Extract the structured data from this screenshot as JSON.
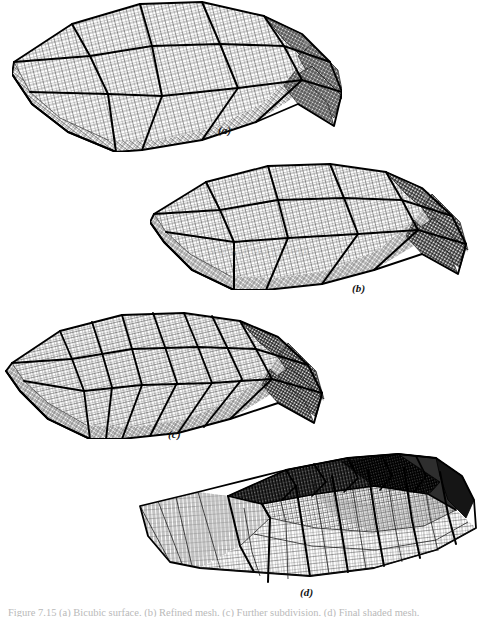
{
  "figure": {
    "type": "technical-illustration",
    "background_color": "#ffffff",
    "ink_color": "#000000",
    "caption_text": "Figure 7.15  (a) Bicubic surface. (b) Refined mesh. (c) Further subdivision. (d) Final shaded mesh.",
    "watermark_text": "www.docin.com",
    "panels": [
      {
        "id": "a",
        "label": "(a)",
        "label_x": 218,
        "label_y": 124,
        "origin_x": 12,
        "origin_y": 0,
        "width": 330,
        "height": 150,
        "patch_cols": 3,
        "patch_rows": 3,
        "fine_cols": 26,
        "fine_rows": 22,
        "shade": "#b7b7b7",
        "description": "Coarse patch layout, fine underlying grid, curved vaulted roof form"
      },
      {
        "id": "b",
        "label": "(b)",
        "label_x": 352,
        "label_y": 282,
        "origin_x": 150,
        "origin_y": 158,
        "width": 330,
        "height": 130,
        "patch_cols": 4,
        "patch_rows": 3,
        "fine_cols": 28,
        "fine_rows": 22,
        "shade": "#b0b0b0",
        "description": "Same surface with one additional column of patches"
      },
      {
        "id": "c",
        "label": "(c)",
        "label_x": 168,
        "label_y": 428,
        "origin_x": 2,
        "origin_y": 305,
        "width": 330,
        "height": 130,
        "patch_cols": 6,
        "patch_rows": 3,
        "fine_cols": 30,
        "fine_rows": 22,
        "shade": "#a8a8a8",
        "description": "Denser patch subdivision across the span"
      },
      {
        "id": "d",
        "label": "(d)",
        "label_x": 300,
        "label_y": 586,
        "origin_x": 136,
        "origin_y": 452,
        "width": 344,
        "height": 132,
        "patch_cols": 7,
        "patch_rows": 4,
        "fine_cols": 34,
        "fine_rows": 24,
        "shade": "#3a3a3a",
        "description": "Flatter viewing angle, creased/folded ridge with dark shaded far side"
      }
    ]
  }
}
